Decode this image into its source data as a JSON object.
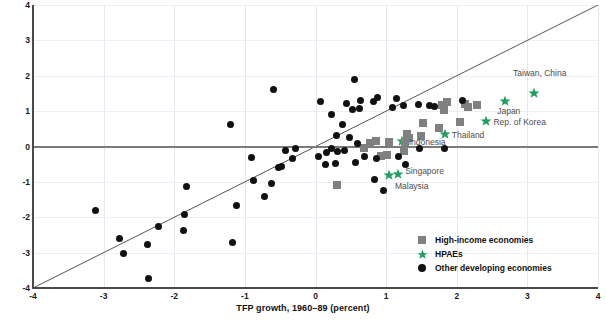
{
  "chart_data": {
    "type": "scatter",
    "title": "",
    "xlabel": "TFP growth, 1960–89 (percent)",
    "ylabel": "",
    "xlim": [
      -4,
      4
    ],
    "ylim": [
      -4,
      4
    ],
    "xticks": [
      "-4",
      "-3",
      "-2",
      "-1",
      "0",
      "1",
      "2",
      "3",
      "4"
    ],
    "yticks": [
      "4",
      "3",
      "2",
      "1",
      "0",
      "-1",
      "-2",
      "-3",
      "-4"
    ],
    "grid": true,
    "reference_line": {
      "type": "45-degree",
      "from": [
        -4,
        -4
      ],
      "to": [
        4,
        4
      ]
    },
    "legend": {
      "position": "bottom-right",
      "entries": [
        {
          "label": "High-income economies",
          "marker": "square",
          "color": "#808080"
        },
        {
          "label": "HPAEs",
          "marker": "star",
          "color": "#1f9e5f"
        },
        {
          "label": "Other developing economies",
          "marker": "circle",
          "color": "#111111"
        }
      ]
    },
    "series": [
      {
        "name": "HPAEs",
        "marker": "star",
        "color": "#1f9e5f",
        "points": [
          {
            "x": 3.09,
            "y": 1.52,
            "label": "Taiwan, China",
            "label_dx": 6,
            "label_dy": -20,
            "label_anchor": "middle"
          },
          {
            "x": 2.68,
            "y": 1.28,
            "label": "Japan",
            "label_dx": 4,
            "label_dy": 10,
            "label_anchor": "middle"
          },
          {
            "x": 2.42,
            "y": 0.72,
            "label": "Rep. of Korea",
            "label_dx": 7,
            "label_dy": 1,
            "label_anchor": "start"
          },
          {
            "x": 1.83,
            "y": 0.36,
            "label": "Thailand",
            "label_dx": 7,
            "label_dy": 1,
            "label_anchor": "start"
          },
          {
            "x": 1.22,
            "y": 0.16,
            "label": "Indonesia",
            "label_dx": 7,
            "label_dy": 1,
            "label_anchor": "start"
          },
          {
            "x": 1.17,
            "y": -0.77,
            "label": "Singapore",
            "label_dx": 7,
            "label_dy": -3,
            "label_anchor": "start"
          },
          {
            "x": 1.04,
            "y": -0.8,
            "label": "Malaysia",
            "label_dx": 6,
            "label_dy": 11,
            "label_anchor": "start"
          }
        ]
      },
      {
        "name": "High-income economies",
        "marker": "square",
        "color": "#808080",
        "points": [
          {
            "x": 1.86,
            "y": 1.27
          },
          {
            "x": 1.79,
            "y": 1.16
          },
          {
            "x": 1.82,
            "y": 1.03
          },
          {
            "x": 2.12,
            "y": 1.2
          },
          {
            "x": 2.16,
            "y": 1.13
          },
          {
            "x": 2.28,
            "y": 1.17
          },
          {
            "x": 2.05,
            "y": 0.68
          },
          {
            "x": 1.52,
            "y": 0.66
          },
          {
            "x": 1.49,
            "y": 0.29
          },
          {
            "x": 1.33,
            "y": 0.25
          },
          {
            "x": 1.3,
            "y": 0.34
          },
          {
            "x": 1.27,
            "y": 0.13
          },
          {
            "x": 1.04,
            "y": 0.14
          },
          {
            "x": 0.86,
            "y": 0.16
          },
          {
            "x": 0.77,
            "y": 0.11
          },
          {
            "x": 0.68,
            "y": -0.04
          },
          {
            "x": 1.25,
            "y": -0.12
          },
          {
            "x": 1.01,
            "y": -0.23
          },
          {
            "x": 0.93,
            "y": -0.28
          },
          {
            "x": 0.31,
            "y": -1.1
          },
          {
            "x": 1.75,
            "y": 0.52
          }
        ]
      },
      {
        "name": "Other developing economies",
        "marker": "circle",
        "color": "#111111",
        "points": [
          {
            "x": -0.6,
            "y": 1.62
          },
          {
            "x": -1.2,
            "y": 0.61
          },
          {
            "x": 0.55,
            "y": 1.9
          },
          {
            "x": 0.07,
            "y": 1.26
          },
          {
            "x": 0.23,
            "y": 0.9
          },
          {
            "x": 0.38,
            "y": 0.61
          },
          {
            "x": 0.44,
            "y": 1.22
          },
          {
            "x": 0.52,
            "y": 1.05
          },
          {
            "x": 0.62,
            "y": 1.08
          },
          {
            "x": 0.64,
            "y": 1.3
          },
          {
            "x": 0.82,
            "y": 1.27
          },
          {
            "x": 0.88,
            "y": 1.39
          },
          {
            "x": 1.09,
            "y": 1.1
          },
          {
            "x": 1.15,
            "y": 1.37
          },
          {
            "x": 1.24,
            "y": 1.16
          },
          {
            "x": 1.46,
            "y": 1.18
          },
          {
            "x": 1.62,
            "y": 1.17
          },
          {
            "x": 1.68,
            "y": 1.12
          },
          {
            "x": 2.08,
            "y": 1.3
          },
          {
            "x": 0.3,
            "y": 0.3
          },
          {
            "x": 0.48,
            "y": 0.25
          },
          {
            "x": 0.6,
            "y": 0.08
          },
          {
            "x": 0.22,
            "y": -0.05
          },
          {
            "x": 0.41,
            "y": -0.12
          },
          {
            "x": 0.7,
            "y": -0.28
          },
          {
            "x": 0.86,
            "y": -0.35
          },
          {
            "x": 1.28,
            "y": -0.5
          },
          {
            "x": 1.47,
            "y": -0.05
          },
          {
            "x": 1.82,
            "y": -0.07
          },
          {
            "x": 1.18,
            "y": -0.27
          },
          {
            "x": 0.04,
            "y": -0.28
          },
          {
            "x": 0.14,
            "y": -0.52
          },
          {
            "x": 0.29,
            "y": -0.49
          },
          {
            "x": 0.56,
            "y": -0.46
          },
          {
            "x": 0.83,
            "y": -0.93
          },
          {
            "x": 0.96,
            "y": -1.24
          },
          {
            "x": 0.15,
            "y": -0.16
          },
          {
            "x": 0.31,
            "y": -0.14
          },
          {
            "x": -0.28,
            "y": -0.05
          },
          {
            "x": -0.42,
            "y": -0.11
          },
          {
            "x": -0.33,
            "y": -0.34
          },
          {
            "x": -0.48,
            "y": -0.57
          },
          {
            "x": -0.52,
            "y": -0.6
          },
          {
            "x": -0.62,
            "y": -1.04
          },
          {
            "x": -0.72,
            "y": -1.4
          },
          {
            "x": -0.88,
            "y": -0.96
          },
          {
            "x": -0.9,
            "y": -0.3
          },
          {
            "x": -1.12,
            "y": -1.68
          },
          {
            "x": -1.18,
            "y": -2.7
          },
          {
            "x": -1.83,
            "y": -1.12
          },
          {
            "x": -1.86,
            "y": -1.93
          },
          {
            "x": -1.87,
            "y": -2.37
          },
          {
            "x": -2.22,
            "y": -2.27
          },
          {
            "x": -2.38,
            "y": -2.77
          },
          {
            "x": -2.78,
            "y": -2.61
          },
          {
            "x": -2.72,
            "y": -3.03
          },
          {
            "x": -2.37,
            "y": -3.72
          },
          {
            "x": -3.12,
            "y": -1.8
          }
        ]
      }
    ]
  },
  "axis": {
    "x_title": "TFP growth, 1960–89 (percent)"
  }
}
